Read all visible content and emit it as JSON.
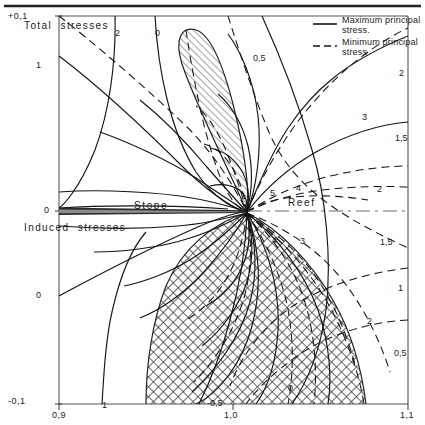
{
  "figure": {
    "title": "",
    "top_rule": true
  },
  "axes": {
    "x": {
      "ticks": [
        "0,9",
        "1,0",
        "1,1"
      ],
      "tick_positions": [
        0.9,
        1.0,
        1.1
      ]
    },
    "y": {
      "ticks": [
        "+0,1",
        "0",
        "-0,1"
      ],
      "tick_positions": [
        0.1,
        0.0,
        -0.1
      ]
    }
  },
  "regions": {
    "total_stresses": "Total  stresses",
    "induced_stresses": "Induced  stresses"
  },
  "features": {
    "stope": "Stope",
    "reef": "Reef"
  },
  "legend": {
    "items": [
      {
        "label_line1": "Maximum principal",
        "label_line2": "stress.",
        "style": "solid"
      },
      {
        "label_line1": "Minimum principal",
        "label_line2": "stress",
        "style": "dashed"
      }
    ]
  },
  "chart_data": {
    "type": "line",
    "xlabel": "",
    "ylabel": "",
    "xlim": [
      0.9,
      1.1
    ],
    "ylim": [
      -0.1,
      0.1
    ],
    "grid": false,
    "legend_position": "top-right",
    "series": [
      {
        "name": "Maximum principal stress",
        "style": "solid",
        "contour_labels": [
          "2",
          "0",
          "1",
          "0",
          "5",
          "4",
          "3",
          "2",
          "-0,5"
        ]
      },
      {
        "name": "Minimum principal stress",
        "style": "dashed",
        "contour_labels": [
          "0,5",
          "2",
          "1,5",
          "2",
          "1,5",
          "1",
          "0,5",
          "0",
          "4",
          "3"
        ]
      }
    ],
    "annotations": [
      {
        "text": "2",
        "x": 115,
        "y": 28
      },
      {
        "text": "0",
        "x": 155,
        "y": 28
      },
      {
        "text": "0,5",
        "x": 253,
        "y": 53
      },
      {
        "text": "2",
        "x": 399,
        "y": 68
      },
      {
        "text": "3",
        "x": 362,
        "y": 112
      },
      {
        "text": "1,5",
        "x": 395,
        "y": 133
      },
      {
        "text": "5",
        "x": 270,
        "y": 188
      },
      {
        "text": "4",
        "x": 296,
        "y": 183
      },
      {
        "text": "2",
        "x": 377,
        "y": 184
      },
      {
        "text": "4",
        "x": 272,
        "y": 235
      },
      {
        "text": "3",
        "x": 300,
        "y": 236
      },
      {
        "text": "1,5",
        "x": 380,
        "y": 237
      },
      {
        "text": "1",
        "x": 398,
        "y": 283
      },
      {
        "text": "2",
        "x": 367,
        "y": 316
      },
      {
        "text": "0,5",
        "x": 394,
        "y": 348
      },
      {
        "text": "1",
        "x": 36,
        "y": 60
      },
      {
        "text": "0",
        "x": 36,
        "y": 290
      },
      {
        "text": "1",
        "x": 102,
        "y": 400
      },
      {
        "text": "-0,5",
        "x": 207,
        "y": 398
      },
      {
        "text": "0",
        "x": 288,
        "y": 383
      }
    ],
    "shaded_regions": [
      {
        "name": "tension-lobe-upper",
        "hatch": "diagonal"
      },
      {
        "name": "tension-zone-lower",
        "hatch": "crosshatch"
      }
    ]
  }
}
